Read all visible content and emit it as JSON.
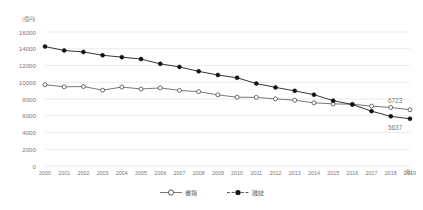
{
  "axes": {
    "y_unit": "(億円)",
    "x_unit": "(年)",
    "y_ticks": [
      "16000",
      "14000",
      "12000",
      "10000",
      "8000",
      "6000",
      "4000",
      "2000",
      "0"
    ],
    "x_ticks": [
      "2000",
      "2001",
      "2002",
      "2003",
      "2004",
      "2005",
      "2006",
      "2007",
      "2008",
      "2009",
      "2010",
      "2011",
      "2012",
      "2013",
      "2014",
      "2015",
      "2016",
      "2017",
      "2018",
      "2019"
    ]
  },
  "legend": {
    "items": [
      {
        "label": "書籍",
        "marker": "open-circle-marker",
        "color": "#555555"
      },
      {
        "label": "雑誌",
        "marker": "filled-circle-marker",
        "color": "#111111"
      }
    ]
  },
  "annotations": {
    "books_end": "6723",
    "magazines_end": "5637"
  },
  "chart_data": {
    "type": "line",
    "title": "",
    "xlabel": "(年)",
    "ylabel": "(億円)",
    "ylim": [
      0,
      16000
    ],
    "ytick_step": 2000,
    "grid": true,
    "legend_position": "bottom-center",
    "categories": [
      "2000",
      "2001",
      "2002",
      "2003",
      "2004",
      "2005",
      "2006",
      "2007",
      "2008",
      "2009",
      "2010",
      "2011",
      "2012",
      "2013",
      "2014",
      "2015",
      "2016",
      "2017",
      "2018",
      "2019"
    ],
    "series": [
      {
        "name": "書籍",
        "marker": "open-circle",
        "color": "#555555",
        "values": [
          9706,
          9456,
          9490,
          9056,
          9429,
          9197,
          9326,
          9026,
          8878,
          8492,
          8213,
          8199,
          8013,
          7851,
          7544,
          7419,
          7370,
          7152,
          6991,
          6723
        ]
      },
      {
        "name": "雑誌",
        "marker": "filled-circle",
        "color": "#111111",
        "values": [
          14261,
          13794,
          13616,
          13222,
          12998,
          12767,
          12200,
          11827,
          11299,
          10864,
          10536,
          9844,
          9385,
          8972,
          8520,
          7801,
          7339,
          6548,
          5930,
          5637
        ]
      }
    ]
  }
}
